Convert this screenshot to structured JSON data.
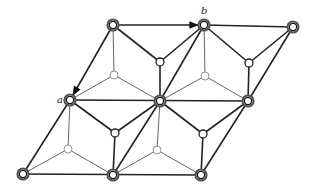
{
  "diagram": {
    "labels": {
      "a": "a",
      "b": "b"
    },
    "colors": {
      "line": "#222222",
      "thin_line": "#555555",
      "background": "#ffffff"
    },
    "nodes": {
      "lattice": [
        {
          "id": "t1",
          "x": 113,
          "y": 25
        },
        {
          "id": "t2",
          "x": 204,
          "y": 25
        },
        {
          "id": "t3",
          "x": 293,
          "y": 27
        },
        {
          "id": "m1",
          "x": 70,
          "y": 100
        },
        {
          "id": "m2",
          "x": 160,
          "y": 101
        },
        {
          "id": "m3",
          "x": 248,
          "y": 101
        },
        {
          "id": "b1",
          "x": 23,
          "y": 174
        },
        {
          "id": "b2",
          "x": 113,
          "y": 175
        },
        {
          "id": "b3",
          "x": 201,
          "y": 175
        }
      ],
      "upper_atoms": [
        {
          "x": 160,
          "y": 62
        },
        {
          "x": 249,
          "y": 63
        },
        {
          "x": 115,
          "y": 133
        },
        {
          "x": 203,
          "y": 134
        }
      ],
      "lower_atoms": [
        {
          "x": 114,
          "y": 75
        },
        {
          "x": 205,
          "y": 76
        },
        {
          "x": 68,
          "y": 149
        },
        {
          "x": 157,
          "y": 150
        }
      ]
    },
    "vectors": [
      {
        "name": "a",
        "from": "t1",
        "to": "m1"
      },
      {
        "name": "b",
        "from": "t1",
        "to": "t2"
      }
    ]
  }
}
